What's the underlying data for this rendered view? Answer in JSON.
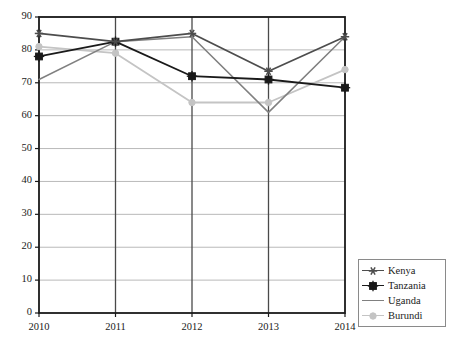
{
  "chart_data": {
    "type": "line",
    "title": "",
    "subtitle": "",
    "xlabel": "",
    "ylabel": "",
    "categories": [
      "2010",
      "2011",
      "2012",
      "2013",
      "2014"
    ],
    "x": [
      2010,
      2011,
      2012,
      2013,
      2014
    ],
    "ylim": [
      0,
      90
    ],
    "yticks": [
      0,
      10,
      20,
      30,
      40,
      50,
      60,
      70,
      80,
      90
    ],
    "ytick_labels": [
      "0",
      "10",
      "20",
      "30",
      "40",
      "50",
      "60",
      "70",
      "80",
      "90"
    ],
    "xtick_labels": [
      "2010",
      "2011",
      "2012",
      "2013",
      "2014"
    ],
    "grid": {
      "horizontal": true,
      "vertical": true,
      "horizontal_color": "#b9b9b9",
      "vertical_color": "#4a4a4a"
    },
    "legend": {
      "position": "outside-bottom-right",
      "border_color": "#8a8a8a",
      "entries": [
        {
          "name": "Kenya",
          "color": "#4d4d4d",
          "marker": "star"
        },
        {
          "name": "Tanzania",
          "color": "#1a1a1a",
          "marker": "plus-square"
        },
        {
          "name": "Uganda",
          "color": "#808080",
          "marker": "none"
        },
        {
          "name": "Burundi",
          "color": "#c4c4c4",
          "marker": "circle"
        }
      ]
    },
    "series": [
      {
        "name": "Kenya",
        "color": "#4d4d4d",
        "marker": "star",
        "values": [
          85.0,
          82.5,
          85.0,
          73.5,
          84.0
        ]
      },
      {
        "name": "Tanzania",
        "color": "#1a1a1a",
        "marker": "plus-square",
        "values": [
          78.0,
          82.5,
          72.0,
          71.0,
          68.5
        ]
      },
      {
        "name": "Uganda",
        "color": "#808080",
        "marker": "none",
        "values": [
          71.0,
          82.5,
          84.0,
          61.0,
          84.0
        ]
      },
      {
        "name": "Burundi",
        "color": "#c4c4c4",
        "marker": "circle",
        "values": [
          81.0,
          79.0,
          64.0,
          64.0,
          74.0
        ]
      }
    ]
  },
  "axes": {
    "frame_color": "#1a1a1a"
  }
}
